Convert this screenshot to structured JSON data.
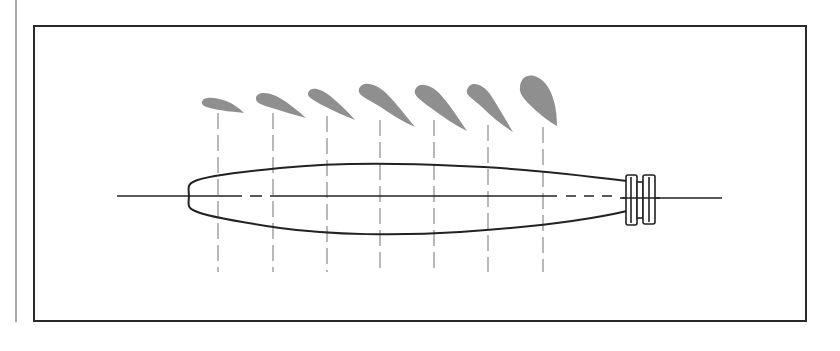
{
  "diagram": {
    "title": "",
    "colors": {
      "background": "#ffffff",
      "frame": "#2a2a2a",
      "margin_line": "#a8a8a8",
      "outline": "#222222",
      "airfoil_fill": "#8f8f8f",
      "station_line": "#8a8a8a"
    },
    "frame": {
      "x": 34,
      "y": 26,
      "width": 772,
      "height": 295
    },
    "margin_line": {
      "x": 16,
      "y1": 0,
      "y2": 322
    },
    "axis": {
      "y": 196,
      "x_start": 117,
      "x_end": 722
    },
    "stations": [
      {
        "index": 1,
        "x": 218,
        "airfoil": {
          "cx": 220,
          "cy": 105,
          "chord": 42,
          "thickness": 10,
          "angle": 22
        }
      },
      {
        "index": 2,
        "x": 273,
        "airfoil": {
          "cx": 280,
          "cy": 104,
          "chord": 52,
          "thickness": 13,
          "angle": 28
        }
      },
      {
        "index": 3,
        "x": 327,
        "airfoil": {
          "cx": 331,
          "cy": 102,
          "chord": 52,
          "thickness": 15,
          "angle": 35
        }
      },
      {
        "index": 4,
        "x": 380,
        "airfoil": {
          "cx": 384,
          "cy": 103,
          "chord": 60,
          "thickness": 19,
          "angle": 42
        }
      },
      {
        "index": 5,
        "x": 434,
        "airfoil": {
          "cx": 438,
          "cy": 105,
          "chord": 62,
          "thickness": 21,
          "angle": 47
        }
      },
      {
        "index": 6,
        "x": 488,
        "airfoil": {
          "cx": 490,
          "cy": 107,
          "chord": 58,
          "thickness": 22,
          "angle": 55
        }
      },
      {
        "index": 7,
        "x": 543,
        "airfoil": {
          "cx": 539,
          "cy": 100,
          "chord": 52,
          "thickness": 32,
          "angle": 68
        }
      }
    ],
    "station_line": {
      "y_top": 113,
      "y_bottom": 272
    },
    "hub": {
      "x": 625,
      "y_top": 174,
      "y_bottom": 222
    }
  }
}
